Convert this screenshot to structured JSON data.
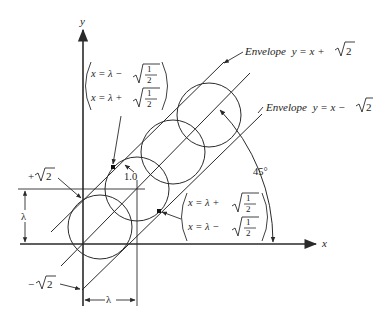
{
  "figure": {
    "width": 373,
    "height": 318,
    "colors": {
      "ink": "#2a2a2a",
      "background": "#ffffff"
    }
  },
  "axes": {
    "x_label": "x",
    "y_label": "y"
  },
  "envelopes": {
    "upper": {
      "label_prefix": "Envelope",
      "label_eq": "y = x +",
      "label_root": "2"
    },
    "lower": {
      "label_prefix": "Envelope",
      "label_eq": "y = x −",
      "label_root": "2"
    }
  },
  "annotations": {
    "upper_tangent": {
      "line1_lhs": "x = λ −",
      "line2_lhs": "x = λ +",
      "frac_num": "1",
      "frac_den": "2"
    },
    "lower_tangent": {
      "line1_lhs": "x = λ +",
      "line2_lhs": "x = λ −",
      "frac_num": "1",
      "frac_den": "2"
    },
    "radius_label": "1.0",
    "angle_label": "45°",
    "plus_root2": {
      "sign": "+",
      "root": "2"
    },
    "minus_root2": {
      "sign": "−",
      "root": "2"
    },
    "lambda_vertical": "λ",
    "lambda_horizontal": "λ"
  },
  "geometry": {
    "origin": [
      83,
      244
    ],
    "circle_radius": 32,
    "circle_centers": [
      [
        100,
        227
      ],
      [
        137,
        189
      ],
      [
        173,
        152
      ],
      [
        209,
        115
      ]
    ]
  }
}
